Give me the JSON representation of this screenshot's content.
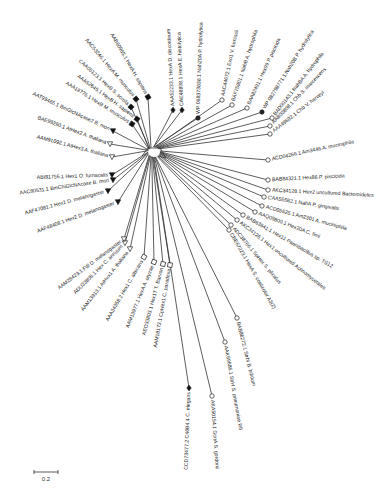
{
  "figure": {
    "type": "unrooted phylogenetic tree",
    "center": [
      150,
      152
    ],
    "scale_bar": {
      "label": "0.2",
      "x1": 34,
      "x2": 58,
      "y": 472
    }
  },
  "leaves": [
    {
      "label": "AAA52233.1 HexA D. discoideum",
      "marker": "diamond-filled",
      "tip": [
        173,
        110
      ],
      "angle": -93
    },
    {
      "label": "CAE48898.1 HexA E. histolytica",
      "marker": "diamond-filled",
      "tip": [
        182,
        110
      ],
      "angle": -92
    },
    {
      "label": "WP 068373636.1 Nah20A P. hydrolytica",
      "marker": "circle-filled",
      "tip": [
        198,
        118
      ],
      "angle": -88
    },
    {
      "label": "AAC44672.1 Exo1 V. furnissii",
      "marker": "circle-open",
      "tip": [
        222,
        100
      ],
      "angle": -78
    },
    {
      "label": "BAF75901.1 NahB A. hydrophila",
      "marker": "circle-open",
      "tip": [
        232,
        105
      ],
      "angle": -72
    },
    {
      "label": "BAA82491.1 Hex99 P. piscicida",
      "marker": "circle-open",
      "tip": [
        247,
        108
      ],
      "angle": -65
    },
    {
      "label": "WP 082798771.1 Nah20B P. hydrolytica",
      "marker": "circle-filled",
      "tip": [
        262,
        112
      ],
      "angle": -58
    },
    {
      "label": "BAD00143.1 NahBA A. hydrophila",
      "marker": "circle-open",
      "tip": [
        272,
        118
      ],
      "angle": -52
    },
    {
      "label": "AAB03808.1 Chb S. marcescens",
      "marker": "circle-open",
      "tip": [
        270,
        126
      ],
      "angle": -46
    },
    {
      "label": "AAA49692.1 Chb V. harveyi",
      "marker": "circle-open",
      "tip": [
        270,
        134
      ],
      "angle": -38
    },
    {
      "label": "ACD04266.1 Am3446 A. muciniphila",
      "marker": "circle-open",
      "tip": [
        268,
        160
      ],
      "angle": -12
    },
    {
      "label": "BAB84321.1 Hex86 P. piscicida",
      "marker": "circle-open",
      "tip": [
        268,
        180
      ],
      "angle": -3
    },
    {
      "label": "AKC34128.1 Hex2 uncultured Bacteroidetes",
      "marker": "circle-open",
      "tip": [
        268,
        190
      ],
      "angle": 3
    },
    {
      "label": "CAA55582.1 NahA P. gingivalis",
      "marker": "circle-open",
      "tip": [
        264,
        197
      ],
      "angle": 9
    },
    {
      "label": "ACD05625.1 Am2301 A. muciniphila",
      "marker": "circle-open",
      "tip": [
        262,
        206
      ],
      "angle": 15
    },
    {
      "label": "AAQ05800.1 Hex20A C. fimi",
      "marker": "circle-open",
      "tip": [
        255,
        212
      ],
      "angle": 21
    },
    {
      "label": "BAB63641.1 Hex11 Paenibacillus sp. TS12",
      "marker": "circle-open",
      "tip": [
        243,
        215
      ],
      "angle": 30
    },
    {
      "label": "AKC34126.1 Hex1 uncultured Actinomycetales",
      "marker": "circle-open",
      "tip": [
        237,
        220
      ],
      "angle": 38
    },
    {
      "label": "ADC38766.1 SpHex S. plicatus",
      "marker": "circle-open",
      "tip": [
        231,
        225
      ],
      "angle": 50
    },
    {
      "label": "CBE67223.1 HexA S. coelicolor A3(2)",
      "marker": "circle-open",
      "tip": [
        229,
        230
      ],
      "angle": 60
    },
    {
      "label": "BAB86272.1 StrbI B. bifidum",
      "marker": "circle-open",
      "tip": [
        237,
        318
      ],
      "angle": 76
    },
    {
      "label": "AAK69686.1 StrH S. pneumoniae R6",
      "marker": "circle-open",
      "tip": [
        225,
        342
      ],
      "angle": 80
    },
    {
      "label": "AKA50154.1 GcnA S. gordonii",
      "marker": "circle-open",
      "tip": [
        212,
        396
      ],
      "angle": 86
    },
    {
      "label": "CCD73477.2 C46B4.4 C. elegans",
      "marker": "diamond-filled",
      "tip": [
        189,
        388
      ],
      "angle": 92
    },
    {
      "label": "AAM18173.1 CpHex1 C. paradoxa",
      "marker": "square-open",
      "tip": [
        170,
        265
      ],
      "angle": 100
    },
    {
      "label": "AEO33803.1 Hex1T T. Barvon",
      "marker": "square-open",
      "tip": [
        163,
        264
      ],
      "angle": 105
    },
    {
      "label": "AAM13977.1 HexA A. oryzae",
      "marker": "square-open",
      "tip": [
        154,
        262
      ],
      "angle": 112
    },
    {
      "label": "AAA34358.2 Hex1 C. albicans",
      "marker": "square-open",
      "tip": [
        144,
        257
      ],
      "angle": 120
    },
    {
      "label": "AAM13913.1 AtHex1 A. thaliana",
      "marker": "triangle-open",
      "tip": [
        130,
        249
      ],
      "angle": 128
    },
    {
      "label": "ADU33805.1 Hex C. annuum",
      "marker": "triangle-open",
      "tip": [
        125,
        243
      ],
      "angle": 135
    },
    {
      "label": "AAM28423.1 Fdl D. melanogaster",
      "marker": "triangle-open",
      "tip": [
        124,
        239
      ],
      "angle": 143
    },
    {
      "label": "AAF48408.1 Hex2 D. melanogaster",
      "marker": "triangle-filled",
      "tip": [
        118,
        202
      ],
      "angle": 160
    },
    {
      "label": "AAF47081.1 Hex1 D. melanogaster",
      "marker": "triangle-filled",
      "tip": [
        108,
        191
      ],
      "angle": 165
    },
    {
      "label": "AAC80531.1 BmChiGlcNAcase B. mori",
      "marker": "triangle-filled",
      "tip": [
        113,
        180
      ],
      "angle": 172
    },
    {
      "label": "ABI81756.1 Hex1 O. furnacalis",
      "marker": "triangle-filled",
      "tip": [
        112,
        175
      ],
      "angle": 178
    },
    {
      "label": "AAM91092.1 AtHex3 A. thaliana",
      "marker": "triangle-open",
      "tip": [
        112,
        157
      ],
      "angle": 195
    },
    {
      "label": "BAE99290.1 AtHex2 A. thaliana",
      "marker": "triangle-open",
      "tip": [
        110,
        144
      ],
      "angle": 200
    },
    {
      "label": "AAT99465.1 BmGlcNAcase2 B. mori",
      "marker": "triangle-filled",
      "tip": [
        113,
        131
      ],
      "angle": 205
    },
    {
      "label": "AAA18776.1 HexB M. musculus",
      "marker": "square-filled",
      "tip": [
        132,
        124
      ],
      "angle": 212
    },
    {
      "label": "AAA52645.1 HexB H. sapiens",
      "marker": "square-filled",
      "tip": [
        137,
        119
      ],
      "angle": 216
    },
    {
      "label": "CAA05123.1 HexB S. scrofa",
      "marker": "square-filled",
      "tip": [
        131,
        107
      ],
      "angle": 222
    },
    {
      "label": "AAC53246.1 HexA M. musculus",
      "marker": "square-filled",
      "tip": [
        136,
        99
      ],
      "angle": 230
    },
    {
      "label": "AAB60965.1 HexA H. sapiens",
      "marker": "square-filled",
      "tip": [
        148,
        97
      ],
      "angle": 240
    }
  ]
}
